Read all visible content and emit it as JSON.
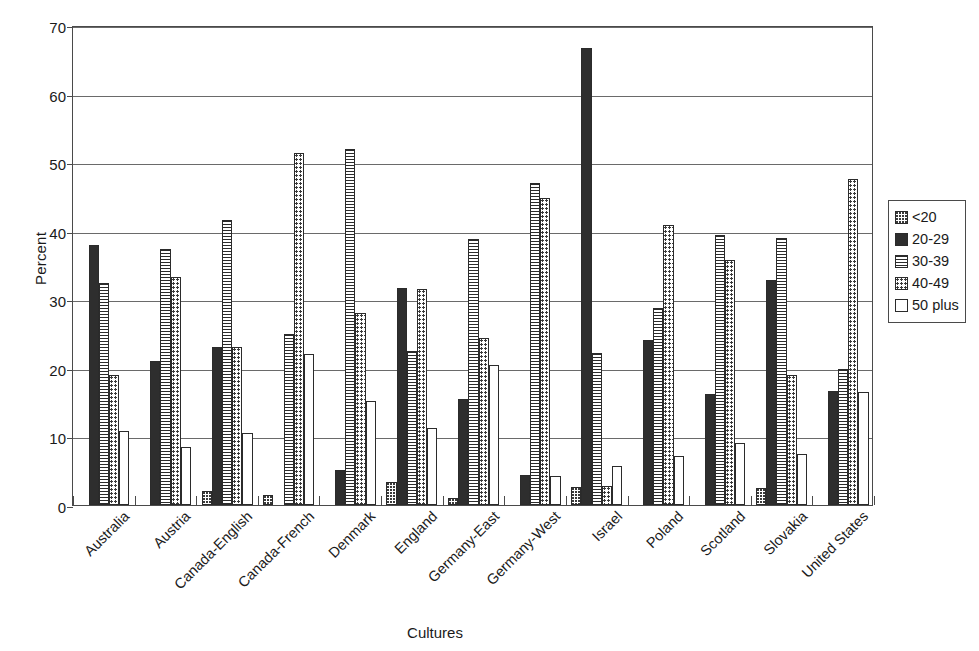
{
  "chart_data": {
    "type": "bar",
    "title": "",
    "xlabel": "Cultures",
    "ylabel": "Percent",
    "ylim": [
      0,
      70
    ],
    "ytick_labels": [
      "0",
      "10",
      "20",
      "30",
      "40",
      "50",
      "60",
      "70"
    ],
    "ytick_values": [
      0,
      10,
      20,
      30,
      40,
      50,
      60,
      70
    ],
    "grid": true,
    "legend_position": "right",
    "categories": [
      "Australia",
      "Austria",
      "Canada-English",
      "Canada-French",
      "Denmark",
      "England",
      "Germany-East",
      "Germany-West",
      "Israel",
      "Poland",
      "Scotland",
      "Slovakia",
      "United States"
    ],
    "series": [
      {
        "name": "<20",
        "swatch": "fill-lt20",
        "values": [
          0,
          0,
          2.1,
          1.4,
          0,
          3.3,
          1.0,
          0,
          2.7,
          0,
          0,
          2.5,
          0
        ]
      },
      {
        "name": "20-29",
        "swatch": "fill-20-29",
        "values": [
          37.9,
          21.0,
          23.0,
          0,
          5.1,
          31.6,
          15.4,
          4.4,
          66.7,
          24.0,
          16.2,
          32.8,
          16.7
        ]
      },
      {
        "name": "30-39",
        "swatch": "fill-30-39",
        "values": [
          32.4,
          37.4,
          41.6,
          25.0,
          51.9,
          22.4,
          38.8,
          46.9,
          22.2,
          28.8,
          39.4,
          39.0,
          19.8
        ]
      },
      {
        "name": "40-49",
        "swatch": "fill-40-49",
        "values": [
          19.0,
          33.3,
          23.0,
          51.4,
          28.0,
          31.5,
          24.4,
          44.8,
          2.8,
          40.8,
          35.8,
          19.0,
          47.5
        ]
      },
      {
        "name": "50 plus",
        "swatch": "fill-50plus",
        "values": [
          10.8,
          8.4,
          10.5,
          22.0,
          15.1,
          11.2,
          20.4,
          4.2,
          5.7,
          7.2,
          9.1,
          7.5,
          16.5
        ]
      }
    ]
  },
  "legend": {
    "items": [
      {
        "label": "<20",
        "swatch": "fill-lt20"
      },
      {
        "label": "20-29",
        "swatch": "fill-20-29"
      },
      {
        "label": "30-39",
        "swatch": "fill-30-39"
      },
      {
        "label": "40-49",
        "swatch": "fill-40-49"
      },
      {
        "label": "50 plus",
        "swatch": "fill-50plus"
      }
    ]
  }
}
